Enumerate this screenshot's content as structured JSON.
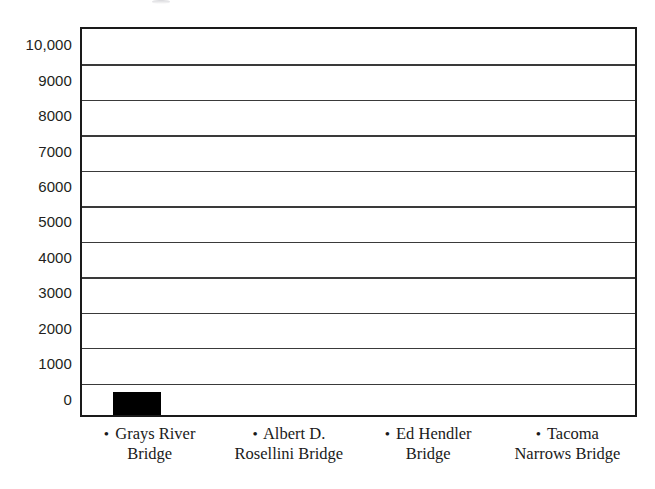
{
  "chart_data": {
    "type": "bar",
    "title": "",
    "subtitle": "",
    "xlabel": "",
    "ylabel": "",
    "categories": [
      "Grays River Bridge",
      "Albert D. Rosellini Bridge",
      "Ed Hendler Bridge",
      "Tacoma Narrows Bridge"
    ],
    "category_labels_line1": [
      "Grays River",
      "Albert D.",
      "Ed Hendler",
      "Tacoma"
    ],
    "category_labels_line2": [
      "Bridge",
      "Rosellini Bridge",
      "Bridge",
      "Narrows Bridge"
    ],
    "values": [
      590,
      0,
      0,
      0
    ],
    "ylim": [
      0,
      10000
    ],
    "ytick_labels": [
      "10,000",
      "9000",
      "8000",
      "7000",
      "6000",
      "5000",
      "4000",
      "3000",
      "2000",
      "1000",
      "0"
    ],
    "ytick_values": [
      10000,
      9000,
      8000,
      7000,
      6000,
      5000,
      4000,
      3000,
      2000,
      1000,
      0
    ],
    "gridlines": true,
    "gridline_count": 10,
    "legend": "none",
    "bullet_glyph": "•",
    "bar_color": "#000000",
    "axis_color": "#1a1a1a",
    "grid_color": "#3a3a3a",
    "background_color": "#ffffff"
  }
}
